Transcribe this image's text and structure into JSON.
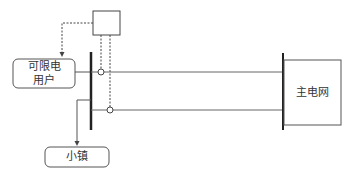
{
  "diagram": {
    "nodes": {
      "limited_user": {
        "line1": "可限电",
        "line2": "用户"
      },
      "town": {
        "label": "小镇"
      },
      "main_grid": {
        "label": "主电网"
      },
      "controller": {
        "label": ""
      }
    },
    "colors": {
      "line": "#444444",
      "bus": "#222222",
      "text": "#333333"
    }
  }
}
